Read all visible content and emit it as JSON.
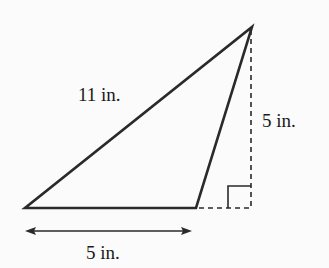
{
  "diagram": {
    "type": "obtuse-triangle-height-base",
    "colors": {
      "stroke": "#2a2a2a",
      "background": "#fbfbfb",
      "text": "#1a1a1a"
    },
    "labels": {
      "slant_side": "11 in.",
      "height": "5 in.",
      "base": "5 in."
    },
    "vertices": {
      "bottom_left": [
        25,
        208
      ],
      "bottom_right": [
        196,
        208
      ],
      "apex": [
        252,
        27
      ]
    },
    "height_line": {
      "x": 251,
      "y_top": 28,
      "y_bottom": 208,
      "style": "dashed"
    },
    "base_extension": {
      "x_start": 196,
      "x_end": 251,
      "y": 208,
      "style": "dashed"
    },
    "right_angle_marker": {
      "x": 227,
      "y": 186,
      "size": 22
    },
    "base_dimension_arrow": {
      "x_start": 25,
      "x_end": 192,
      "y": 231
    }
  }
}
